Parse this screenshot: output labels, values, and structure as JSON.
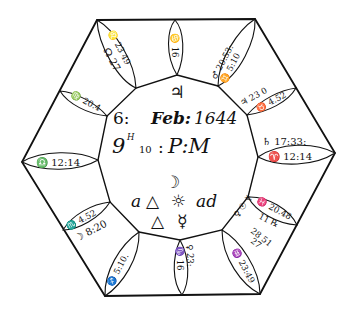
{
  "center": {
    "top_symbol": "♃",
    "date_line": {
      "day": "6:",
      "month": "Feb:",
      "year": "1644"
    },
    "time_line": {
      "hour": "9",
      "hour_mark": "H",
      "minute": "10",
      "sep": ":",
      "ampm": "P:M"
    },
    "aspect": {
      "moon": "☽",
      "a": "a",
      "trine1": "△",
      "sun": "☼",
      "ad": "ad",
      "trine2": "△",
      "mercury": "☿"
    }
  },
  "houses": [
    {
      "id": "top",
      "leaf": "♋ 16"
    },
    {
      "id": "top-right",
      "outer": "♂ 20:53:",
      "leaf": "♊ 5:10"
    },
    {
      "id": "right-upper",
      "outer": "♃ 23 0",
      "leaf": "♉ 4.52"
    },
    {
      "id": "right",
      "outer": "♄ 17:33:",
      "leaf": "♈ 12:14"
    },
    {
      "id": "right-lower",
      "leaf": "♓ 20.48",
      "planets": [
        "♀ ☉ ☿",
        "11 ℞",
        "28 51",
        "27"
      ]
    },
    {
      "id": "bottom-right",
      "leaf": "♒ 23:49"
    },
    {
      "id": "bottom",
      "outer": "♀ 23:",
      "leaf": "♑ 16"
    },
    {
      "id": "bottom-left",
      "leaf": "♐ 5:10."
    },
    {
      "id": "left-lower",
      "outer": "☽ 8:20",
      "leaf": "♏ 4.52",
      "extra": "☋"
    },
    {
      "id": "left",
      "leaf": "♎ 12:14"
    },
    {
      "id": "left-upper",
      "leaf": "♍ 20.4"
    },
    {
      "id": "top-left",
      "outer": "☊ 27",
      "leaf": "♌ 23 49"
    }
  ]
}
